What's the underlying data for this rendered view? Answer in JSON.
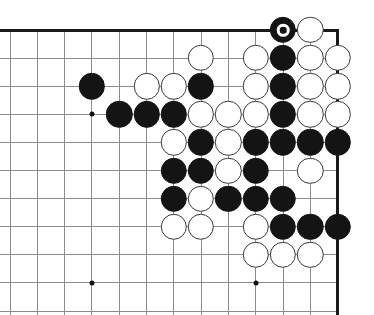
{
  "board": {
    "title": "Go board diagram",
    "corner": "top-right",
    "line_color": "#8c8c8c",
    "edge_color": "#1a1a1a",
    "black_color": "#141414",
    "white_color": "#ffffff",
    "white_border_color": "#3a3a3a",
    "hoshi_color": "#111111",
    "origin_x": 10,
    "origin_y": 30,
    "col_step": 27.3,
    "row_step": 28.1,
    "cols": 12,
    "rows": 10,
    "stone_radius": 13.2,
    "right_edge_col": 12,
    "top_edge_row": 0,
    "hoshi_points": [
      {
        "col": 3,
        "row": 3
      },
      {
        "col": 3,
        "row": 9
      },
      {
        "col": 9,
        "row": 9
      },
      {
        "col": 9,
        "row": 3
      }
    ],
    "stones": [
      {
        "col": 10,
        "row": 0,
        "color": "black",
        "marked": true
      },
      {
        "col": 11,
        "row": 0,
        "color": "white",
        "marked": false
      },
      {
        "col": 7,
        "row": 1,
        "color": "white",
        "marked": false
      },
      {
        "col": 9,
        "row": 1,
        "color": "white",
        "marked": false
      },
      {
        "col": 10,
        "row": 1,
        "color": "black",
        "marked": false
      },
      {
        "col": 11,
        "row": 1,
        "color": "white",
        "marked": false
      },
      {
        "col": 12,
        "row": 1,
        "color": "white",
        "marked": false
      },
      {
        "col": 3,
        "row": 2,
        "color": "black",
        "marked": false
      },
      {
        "col": 5,
        "row": 2,
        "color": "white",
        "marked": false
      },
      {
        "col": 6,
        "row": 2,
        "color": "white",
        "marked": false
      },
      {
        "col": 7,
        "row": 2,
        "color": "black",
        "marked": false
      },
      {
        "col": 9,
        "row": 2,
        "color": "white",
        "marked": false
      },
      {
        "col": 10,
        "row": 2,
        "color": "black",
        "marked": false
      },
      {
        "col": 11,
        "row": 2,
        "color": "white",
        "marked": false
      },
      {
        "col": 12,
        "row": 2,
        "color": "white",
        "marked": false
      },
      {
        "col": 4,
        "row": 3,
        "color": "black",
        "marked": false
      },
      {
        "col": 5,
        "row": 3,
        "color": "black",
        "marked": false
      },
      {
        "col": 6,
        "row": 3,
        "color": "black",
        "marked": false
      },
      {
        "col": 7,
        "row": 3,
        "color": "white",
        "marked": false
      },
      {
        "col": 8,
        "row": 3,
        "color": "white",
        "marked": false
      },
      {
        "col": 9,
        "row": 3,
        "color": "white",
        "marked": false
      },
      {
        "col": 10,
        "row": 3,
        "color": "black",
        "marked": false
      },
      {
        "col": 11,
        "row": 3,
        "color": "white",
        "marked": false
      },
      {
        "col": 12,
        "row": 3,
        "color": "white",
        "marked": false
      },
      {
        "col": 6,
        "row": 4,
        "color": "white",
        "marked": false
      },
      {
        "col": 7,
        "row": 4,
        "color": "black",
        "marked": false
      },
      {
        "col": 8,
        "row": 4,
        "color": "white",
        "marked": false
      },
      {
        "col": 9,
        "row": 4,
        "color": "black",
        "marked": false
      },
      {
        "col": 10,
        "row": 4,
        "color": "black",
        "marked": false
      },
      {
        "col": 11,
        "row": 4,
        "color": "black",
        "marked": false
      },
      {
        "col": 12,
        "row": 4,
        "color": "black",
        "marked": false
      },
      {
        "col": 6,
        "row": 5,
        "color": "black",
        "marked": false
      },
      {
        "col": 7,
        "row": 5,
        "color": "black",
        "marked": false
      },
      {
        "col": 8,
        "row": 5,
        "color": "white",
        "marked": false
      },
      {
        "col": 9,
        "row": 5,
        "color": "black",
        "marked": false
      },
      {
        "col": 11,
        "row": 5,
        "color": "white",
        "marked": false
      },
      {
        "col": 6,
        "row": 6,
        "color": "black",
        "marked": false
      },
      {
        "col": 7,
        "row": 6,
        "color": "white",
        "marked": false
      },
      {
        "col": 8,
        "row": 6,
        "color": "black",
        "marked": false
      },
      {
        "col": 9,
        "row": 6,
        "color": "black",
        "marked": false
      },
      {
        "col": 10,
        "row": 6,
        "color": "black",
        "marked": false
      },
      {
        "col": 6,
        "row": 7,
        "color": "white",
        "marked": false
      },
      {
        "col": 7,
        "row": 7,
        "color": "white",
        "marked": false
      },
      {
        "col": 9,
        "row": 7,
        "color": "white",
        "marked": false
      },
      {
        "col": 10,
        "row": 7,
        "color": "black",
        "marked": false
      },
      {
        "col": 11,
        "row": 7,
        "color": "black",
        "marked": false
      },
      {
        "col": 12,
        "row": 7,
        "color": "black",
        "marked": false
      },
      {
        "col": 9,
        "row": 8,
        "color": "white",
        "marked": false
      },
      {
        "col": 10,
        "row": 8,
        "color": "white",
        "marked": false
      },
      {
        "col": 11,
        "row": 8,
        "color": "white",
        "marked": false
      }
    ]
  }
}
